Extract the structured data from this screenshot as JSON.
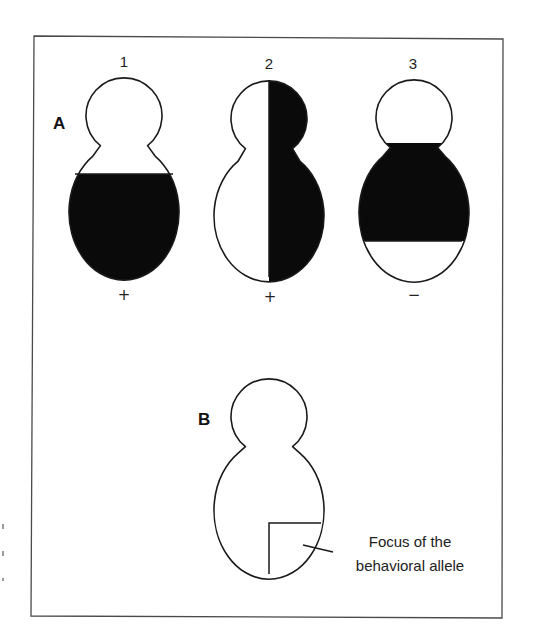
{
  "figure": {
    "panel_a": {
      "label": "A",
      "flies": [
        {
          "number": "1",
          "result": "+",
          "pattern": "lower-body-shaded"
        },
        {
          "number": "2",
          "result": "+",
          "pattern": "right-half-shaded"
        },
        {
          "number": "3",
          "result": "−",
          "pattern": "mid-body-band-shaded"
        }
      ]
    },
    "panel_b": {
      "label": "B",
      "annotation_lines": [
        "Focus of the",
        "behavioral allele"
      ]
    },
    "colors": {
      "shaded": "#0a0a0a",
      "unshaded": "#ffffff",
      "outline": "#1a1a1a"
    }
  }
}
